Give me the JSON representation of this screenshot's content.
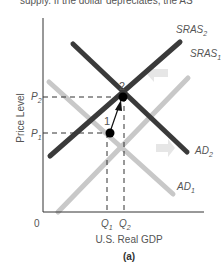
{
  "top_text": "supply. If the dollar depreciates, the AS",
  "diagram": {
    "panel_label": "(a)",
    "x_axis_label": "U.S. Real GDP",
    "y_axis_label": "Price Level",
    "origin_label": "0",
    "price_ticks": [
      {
        "label": "P",
        "sub": "1"
      },
      {
        "label": "P",
        "sub": "2"
      }
    ],
    "quantity_ticks": [
      {
        "label": "Q",
        "sub": "1"
      },
      {
        "label": "Q",
        "sub": "2"
      }
    ],
    "curves": [
      {
        "name": "SRAS",
        "sub": "1",
        "color": "#c8c8c8"
      },
      {
        "name": "SRAS",
        "sub": "2",
        "color": "#3a3a3a"
      },
      {
        "name": "AD",
        "sub": "1",
        "color": "#c8c8c8"
      },
      {
        "name": "AD",
        "sub": "2",
        "color": "#3a3a3a"
      }
    ],
    "points": [
      {
        "label": "1",
        "description": "initial equilibrium at P1, Q1"
      },
      {
        "label": "2",
        "description": "new equilibrium at P2, Q2"
      }
    ],
    "colors": {
      "dark_curve": "#3a3a3a",
      "light_curve": "#c8c8c8",
      "shift_arrow": "#e6e6e6",
      "axis": "#333333"
    }
  }
}
